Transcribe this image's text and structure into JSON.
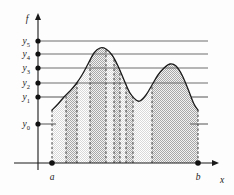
{
  "figure": {
    "background_color": "#fdfdfd",
    "ink_color": "#1a1a1a",
    "band_light_color": "#e3e3e3",
    "band_dark_color": "#c2c2c2",
    "level_line_color": "#6f6f6f"
  },
  "axes": {
    "x_axis": {
      "label": "x",
      "label_x": 222,
      "label_y": 183,
      "y": 163,
      "x_start": 14,
      "x_end": 216,
      "arrow": true
    },
    "y_axis": {
      "label": "f",
      "label_x": 27,
      "label_y": 22,
      "x": 38,
      "y_start": 170,
      "y_end": 14,
      "arrow": true
    }
  },
  "y_levels": [
    {
      "id": "y5",
      "base": "y",
      "sub": "5",
      "value": 5,
      "pixel_y": 41,
      "line_x_end": 208,
      "dot": true,
      "broken": false
    },
    {
      "id": "y4",
      "base": "y",
      "sub": "4",
      "value": 4,
      "pixel_y": 54,
      "line_x_end": 208,
      "dot": true,
      "broken": false
    },
    {
      "id": "y3",
      "base": "y",
      "sub": "3",
      "value": 3,
      "pixel_y": 68,
      "line_x_end": 208,
      "dot": true,
      "broken": false
    },
    {
      "id": "y2",
      "base": "y",
      "sub": "2",
      "value": 2,
      "pixel_y": 83,
      "line_x_end": 208,
      "dot": true,
      "broken": false
    },
    {
      "id": "y1",
      "base": "y",
      "sub": "1",
      "value": 1,
      "pixel_y": 97,
      "line_x_end": 208,
      "dot": true,
      "broken": true
    },
    {
      "id": "y0",
      "base": "y",
      "sub": "0",
      "value": 0,
      "pixel_y": 124,
      "line_x_end": 208,
      "dot": true,
      "broken": true
    }
  ],
  "x_points": [
    {
      "id": "a",
      "label": "a",
      "pixel_x": 52,
      "label_y": 180,
      "dot": true
    },
    {
      "id": "b",
      "label": "b",
      "pixel_x": 198,
      "label_y": 180,
      "dot": true
    }
  ],
  "curve": {
    "description": "smooth bimodal function f on [a,b]",
    "start_pixel": {
      "x": 52,
      "y": 110
    },
    "end_pixel": {
      "x": 198,
      "y": 110
    },
    "peaks": [
      {
        "pixel_x": 100,
        "pixel_y": 48,
        "near_level": "y4"
      },
      {
        "pixel_x": 172,
        "pixel_y": 64,
        "near_level": "y3"
      }
    ],
    "valley": {
      "pixel_x": 140,
      "pixel_y": 101,
      "near_level": "y1"
    }
  },
  "bands": [
    {
      "index": 0,
      "x_left": 52,
      "x_right": 66,
      "shade": "light"
    },
    {
      "index": 1,
      "x_left": 66,
      "x_right": 77,
      "shade": "dark"
    },
    {
      "index": 2,
      "x_left": 77,
      "x_right": 90,
      "shade": "light"
    },
    {
      "index": 3,
      "x_left": 90,
      "x_right": 106,
      "shade": "dark"
    },
    {
      "index": 4,
      "x_left": 106,
      "x_right": 114,
      "shade": "light"
    },
    {
      "index": 5,
      "x_left": 114,
      "x_right": 120,
      "shade": "dark"
    },
    {
      "index": 6,
      "x_left": 120,
      "x_right": 126,
      "shade": "light"
    },
    {
      "index": 7,
      "x_left": 126,
      "x_right": 133,
      "shade": "dark"
    },
    {
      "index": 8,
      "x_left": 133,
      "x_right": 152,
      "shade": "light"
    },
    {
      "index": 9,
      "x_left": 152,
      "x_right": 198,
      "shade": "dark"
    }
  ],
  "divider_lines_x": [
    52,
    66,
    77,
    90,
    106,
    114,
    120,
    126,
    133,
    152,
    198
  ],
  "chart_data": {
    "type": "area",
    "title": "",
    "xlabel": "x",
    "ylabel": "f",
    "grid": true,
    "legend": null,
    "x_tick_labels": [
      "a",
      "b"
    ],
    "x_tick_values": [
      52,
      198
    ],
    "y_tick_labels": [
      "y0",
      "y1",
      "y2",
      "y3",
      "y4",
      "y5"
    ],
    "y_tick_values": [
      0,
      1,
      2,
      3,
      4,
      5
    ],
    "ylim": [
      0,
      5.6
    ],
    "series": [
      {
        "name": "f",
        "x": [
          52,
          58,
          64,
          70,
          76,
          82,
          88,
          94,
          100,
          106,
          112,
          118,
          124,
          130,
          136,
          140,
          146,
          152,
          158,
          164,
          170,
          176,
          182,
          188,
          194,
          198
        ],
        "y_pixel": [
          110,
          104,
          97,
          91,
          84,
          75,
          64,
          53,
          48,
          49,
          55,
          66,
          80,
          93,
          100,
          101,
          95,
          85,
          75,
          68,
          64,
          66,
          75,
          89,
          104,
          110
        ],
        "y_value": [
          1.15,
          1.37,
          1.62,
          1.84,
          2.1,
          2.43,
          2.83,
          3.24,
          3.42,
          3.38,
          3.16,
          2.75,
          2.23,
          1.75,
          1.5,
          1.46,
          1.68,
          2.05,
          2.42,
          2.68,
          2.83,
          2.75,
          2.42,
          1.9,
          1.35,
          1.15
        ]
      }
    ],
    "annotations": [
      {
        "text": "a",
        "x": 52,
        "kind": "x-mark"
      },
      {
        "text": "b",
        "x": 198,
        "kind": "x-mark"
      }
    ]
  }
}
